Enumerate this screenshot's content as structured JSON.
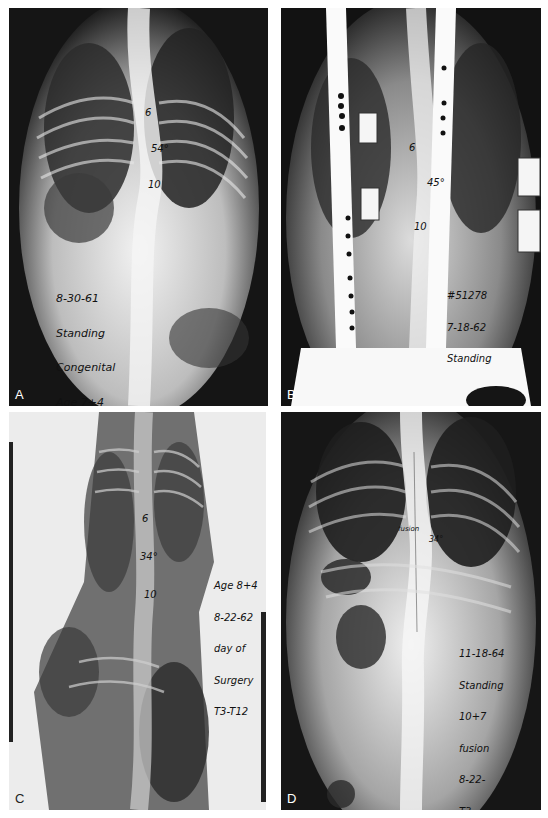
{
  "figure": {
    "panels": [
      {
        "id": "A",
        "label": "A",
        "vertebra_marks": [
          "6",
          "10"
        ],
        "curve_angle": "54°",
        "annotation": [
          "8-30-61",
          "Standing",
          "Congenital",
          "Age 7+4"
        ]
      },
      {
        "id": "B",
        "label": "B",
        "vertebra_marks": [
          "6",
          "10"
        ],
        "curve_angle": "45°",
        "annotation": [
          "#51278",
          "7-18-62",
          "Standing"
        ]
      },
      {
        "id": "C",
        "label": "C",
        "vertebra_marks": [
          "6",
          "10"
        ],
        "curve_angle": "34°",
        "annotation": [
          "Age 8+4",
          "8-22-62",
          "day of",
          "Surgery",
          "T3-T12"
        ]
      },
      {
        "id": "D",
        "label": "D",
        "vertebra_marks": [
          "fusion"
        ],
        "curve_angle": "34°",
        "annotation": [
          "11-18-64",
          "Standing",
          "10+7",
          "fusion",
          "8-22-",
          "T3"
        ]
      }
    ]
  }
}
